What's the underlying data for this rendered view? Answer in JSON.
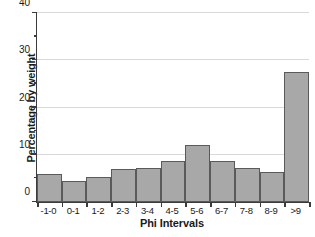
{
  "chart_data": {
    "type": "bar",
    "title": "",
    "xlabel": "Phi Intervals",
    "ylabel": "Percentage by weight",
    "categories": [
      "-1-0",
      "0-1",
      "1-2",
      "2-3",
      "3-4",
      "4-5",
      "5-6",
      "6-7",
      "7-8",
      "8-9",
      ">9"
    ],
    "values": [
      6.0,
      4.4,
      5.3,
      6.9,
      7.3,
      8.6,
      12.1,
      8.6,
      7.3,
      6.3,
      27.5
    ],
    "ylim": [
      0,
      40
    ],
    "xlim_type": "categorical",
    "ytick_labels": [
      "0",
      "10",
      "20",
      "30",
      "40"
    ],
    "ytick_values": [
      0,
      10,
      20,
      30,
      40
    ],
    "yminor_tick_values": [
      5,
      15,
      25,
      35
    ],
    "gridlines": {
      "horizontal": true,
      "vertical": false,
      "at": [
        10,
        20,
        30,
        40
      ]
    },
    "legend": {
      "visible": false,
      "position": "none"
    },
    "colors": {
      "bar_fill": "#a8a8a8",
      "bar_border": "#5a5a5a",
      "axis": "#3b3b3b",
      "gridline": "#d9d9d9",
      "background": "#ffffff",
      "text": "#1a1a1a"
    }
  }
}
